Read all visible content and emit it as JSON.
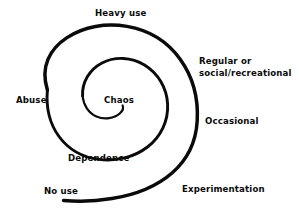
{
  "diagram": {
    "type": "spiral-progression-diagram",
    "background_color": "#ffffff",
    "stroke_color": "#0a0a0a",
    "text_color": "#0a0a0a",
    "spiral": {
      "name": "addiction-progression-spiral",
      "turns": 1.75,
      "direction": "inward-counterclockwise",
      "center_x": 122,
      "center_y": 100,
      "outer_stroke_width": 3.6,
      "inner_stroke_width": 1.9,
      "tail_start_x": 63,
      "tail_start_y": 200,
      "inner_end_x": 122,
      "inner_end_y": 112
    },
    "labels": [
      {
        "id": "no-use",
        "text": "No use",
        "position": "bottom-left",
        "lines": [
          "No use"
        ]
      },
      {
        "id": "experimentation",
        "text": "Experimentation",
        "position": "bottom-right",
        "lines": [
          "Experimentation"
        ]
      },
      {
        "id": "occasional",
        "text": "Occasional",
        "position": "right",
        "lines": [
          "Occasional"
        ]
      },
      {
        "id": "regular",
        "text": "Regular or social/recreational",
        "position": "upper-right",
        "lines": [
          "Regular or",
          "social/recreational"
        ]
      },
      {
        "id": "heavy-use",
        "text": "Heavy use",
        "position": "top",
        "lines": [
          "Heavy use"
        ]
      },
      {
        "id": "abuse",
        "text": "Abuse",
        "position": "left",
        "lines": [
          "Abuse"
        ]
      },
      {
        "id": "dependence",
        "text": "Dependence",
        "position": "bottom-center",
        "lines": [
          "Dependence"
        ]
      },
      {
        "id": "chaos",
        "text": "Chaos",
        "position": "center",
        "lines": [
          "Chaos"
        ]
      }
    ],
    "label_text": {
      "no_use": "No use",
      "experimentation": "Experimentation",
      "occasional": "Occasional",
      "regular_line1": "Regular or",
      "regular_line2": "social/recreational",
      "heavy_use": "Heavy use",
      "abuse": "Abuse",
      "dependence": "Dependence",
      "chaos": "Chaos"
    }
  }
}
